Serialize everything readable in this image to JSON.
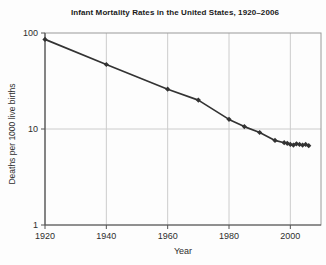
{
  "chart_data": {
    "type": "line",
    "title": "Infant Mortality Rates in the United States, 1920–2006",
    "xlabel": "Year",
    "ylabel": "Deaths per 1000 live births",
    "series": [
      {
        "name": "Infant mortality rate",
        "x": [
          1920,
          1940,
          1960,
          1970,
          1980,
          1985,
          1990,
          1995,
          1998,
          1999,
          2000,
          2001,
          2002,
          2003,
          2004,
          2005,
          2006
        ],
        "values": [
          85.8,
          47.0,
          26.0,
          20.0,
          12.6,
          10.6,
          9.2,
          7.6,
          7.2,
          7.1,
          6.9,
          6.8,
          7.0,
          6.9,
          6.8,
          6.9,
          6.7
        ]
      }
    ],
    "x_ticks": [
      1920,
      1940,
      1960,
      1980,
      2000
    ],
    "y_ticks": [
      1,
      10,
      100
    ],
    "xlim": [
      1920,
      2010
    ],
    "ylim": [
      1,
      100
    ],
    "y_scale": "log",
    "grid": true,
    "legend": "none",
    "colors": {
      "line": "#333333",
      "marker": "#333333",
      "grid": "#cccccc",
      "frame": "#9a9a9a",
      "axis": "#555555",
      "text": "#2e2e2e"
    }
  }
}
